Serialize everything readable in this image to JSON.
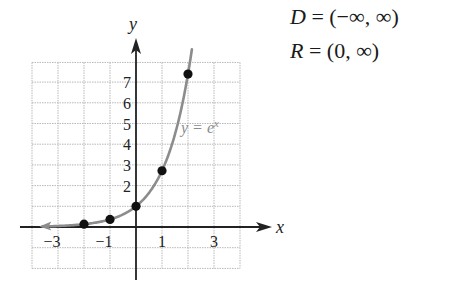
{
  "domain_range": {
    "domain_var": "D",
    "domain_eq": " = (−∞, ∞)",
    "range_var": "R",
    "range_eq": " = (0, ∞)"
  },
  "chart_data": {
    "type": "line",
    "title": "",
    "function_label": "y = e^x",
    "xlabel": "x",
    "ylabel": "y",
    "xlim": [
      -4,
      4
    ],
    "ylim": [
      -1.6,
      7.9
    ],
    "grid": true,
    "x_ticks": [
      -3,
      -1,
      1,
      3
    ],
    "x_tick_labels": [
      "−3",
      "−1",
      "1",
      "3"
    ],
    "y_ticks": [
      2,
      3,
      4,
      5,
      6,
      7
    ],
    "y_tick_labels": [
      "2",
      "3",
      "4",
      "5",
      "6",
      "7"
    ],
    "series": [
      {
        "name": "y = e^x",
        "kind": "curve",
        "x_range": [
          -3.6,
          2.15
        ],
        "color": "#8c8c8c"
      },
      {
        "name": "points",
        "kind": "scatter",
        "x": [
          -2,
          -1,
          0,
          1,
          2
        ],
        "y": [
          0.135,
          0.368,
          1,
          2.718,
          7.389
        ],
        "color": "#111111"
      }
    ],
    "colors": {
      "axis": "#222222",
      "grid": "#b8b8b8",
      "curve": "#8c8c8c",
      "point": "#111111"
    }
  }
}
